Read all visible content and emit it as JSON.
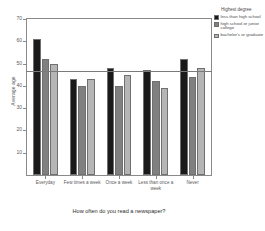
{
  "chart_data": {
    "type": "bar",
    "title": "",
    "xlabel": "How often do you read a newspaper?",
    "ylabel": "Average age",
    "categories": [
      "Everyday",
      "Few times a week",
      "Once a week",
      "Less than once a week",
      "Never"
    ],
    "series": [
      {
        "name": "less than high school",
        "color": "#1a1a1a",
        "values": [
          61,
          43,
          48,
          47,
          52
        ]
      },
      {
        "name": "high school or junior college",
        "color": "#808080",
        "values": [
          52,
          40,
          40,
          42,
          44
        ]
      },
      {
        "name": "bachelor's or graduate",
        "color": "#b5b5b5",
        "values": [
          50,
          43,
          45,
          39,
          48
        ]
      }
    ],
    "ylim": [
      0,
      70
    ],
    "yticks": [
      10,
      20,
      30,
      40,
      50,
      60,
      70
    ],
    "grid": false,
    "reference_line": 46.5,
    "legend": {
      "title": "Highest degree",
      "position": "top-right",
      "entries": [
        {
          "label": "less than high school",
          "color": "#1a1a1a"
        },
        {
          "label": "high school or junior college",
          "color": "#808080"
        },
        {
          "label": "bachelor's or graduate",
          "color": "#b5b5b5"
        }
      ]
    }
  }
}
